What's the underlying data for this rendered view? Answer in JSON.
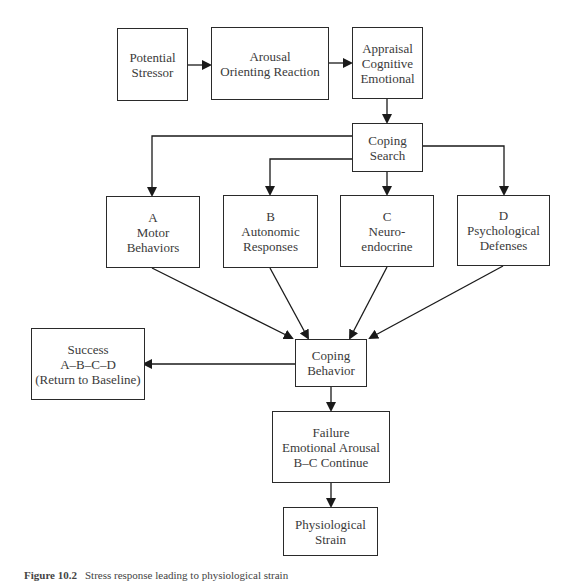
{
  "diagram": {
    "nodes": [
      {
        "id": "potential_stressor",
        "lines": [
          "Potential",
          "Stressor"
        ]
      },
      {
        "id": "arousal",
        "lines": [
          "Arousal",
          "Orienting Reaction"
        ]
      },
      {
        "id": "appraisal",
        "lines": [
          "Appraisal",
          "Cognitive",
          "Emotional"
        ]
      },
      {
        "id": "coping_search",
        "lines": [
          "Coping",
          "Search"
        ]
      },
      {
        "id": "motor",
        "lines": [
          "A",
          "Motor",
          "Behaviors"
        ]
      },
      {
        "id": "autonomic",
        "lines": [
          "B",
          "Autonomic",
          "Responses"
        ]
      },
      {
        "id": "neuroendocrine",
        "lines": [
          "C",
          "Neuro-",
          "endocrine"
        ]
      },
      {
        "id": "psychological",
        "lines": [
          "D",
          "Psychological",
          "Defenses"
        ]
      },
      {
        "id": "coping_behavior",
        "lines": [
          "Coping",
          "Behavior"
        ]
      },
      {
        "id": "success",
        "lines": [
          "Success",
          "A–B–C–D",
          "(Return to Baseline)"
        ]
      },
      {
        "id": "failure",
        "lines": [
          "Failure",
          "Emotional Arousal",
          "B–C Continue"
        ]
      },
      {
        "id": "strain",
        "lines": [
          "Physiological",
          "Strain"
        ]
      }
    ],
    "edges": [
      {
        "from": "potential_stressor",
        "to": "arousal"
      },
      {
        "from": "arousal",
        "to": "appraisal"
      },
      {
        "from": "appraisal",
        "to": "coping_search"
      },
      {
        "from": "coping_search",
        "to": "motor"
      },
      {
        "from": "coping_search",
        "to": "autonomic"
      },
      {
        "from": "coping_search",
        "to": "neuroendocrine"
      },
      {
        "from": "coping_search",
        "to": "psychological"
      },
      {
        "from": "motor",
        "to": "coping_behavior"
      },
      {
        "from": "autonomic",
        "to": "coping_behavior"
      },
      {
        "from": "neuroendocrine",
        "to": "coping_behavior"
      },
      {
        "from": "psychological",
        "to": "coping_behavior"
      },
      {
        "from": "coping_behavior",
        "to": "success"
      },
      {
        "from": "coping_behavior",
        "to": "failure"
      },
      {
        "from": "failure",
        "to": "strain"
      }
    ]
  },
  "caption": {
    "label": "Figure 10.2",
    "text": "Stress response leading to physiological strain"
  },
  "colors": {
    "line": "#1a1a1a",
    "text": "#3a3a3a",
    "background": "#ffffff"
  }
}
